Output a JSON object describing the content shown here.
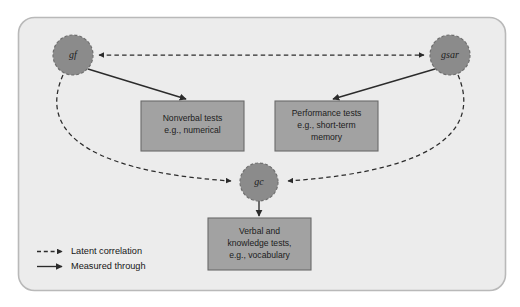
{
  "figure": {
    "type": "diagram",
    "panel": {
      "fill": "#ececec",
      "border": "#b9b9b9"
    },
    "colors": {
      "node_fill": "#8b8b8b",
      "node_stroke": "#6f6f6f",
      "box_fill": "#a2a2a2",
      "box_stroke": "#6a6a6a",
      "line": "#2b2b2b",
      "text": "#1c1c1c"
    }
  },
  "nodes": [
    {
      "id": "gf",
      "label": "gf",
      "cx": 73,
      "cy": 55,
      "r": 20
    },
    {
      "id": "gsar",
      "label": "gsar",
      "cx": 450,
      "cy": 55,
      "r": 20
    },
    {
      "id": "gc",
      "label": "gc",
      "cx": 259,
      "cy": 182,
      "r": 19
    }
  ],
  "boxes": [
    {
      "id": "nonverbal",
      "lines": [
        "Nonverbal tests",
        "e.g., numerical"
      ],
      "x": 141,
      "y": 101,
      "w": 103,
      "h": 50
    },
    {
      "id": "performance",
      "lines": [
        "Performance tests",
        "e.g., short-term",
        "memory"
      ],
      "x": 275,
      "y": 101,
      "w": 103,
      "h": 50
    },
    {
      "id": "verbal",
      "lines": [
        "Verbal and",
        "knowledge tests,",
        "e.g., vocabulary"
      ],
      "x": 208,
      "y": 218,
      "w": 103,
      "h": 52
    }
  ],
  "edges": [
    {
      "id": "gf-gsar-latent",
      "kind": "latent",
      "from": "gf",
      "to": "gsar",
      "bidirectional": true
    },
    {
      "id": "gf-gc-latent",
      "kind": "latent",
      "from": "gf",
      "to": "gc",
      "bidirectional": false
    },
    {
      "id": "gsar-gc-latent",
      "kind": "latent",
      "from": "gsar",
      "to": "gc",
      "bidirectional": false
    },
    {
      "id": "gf-nonverbal",
      "kind": "measured",
      "from": "gf",
      "to": "nonverbal"
    },
    {
      "id": "gsar-performance",
      "kind": "measured",
      "from": "gsar",
      "to": "performance"
    },
    {
      "id": "gc-verbal",
      "kind": "measured",
      "from": "gc",
      "to": "verbal"
    }
  ],
  "legend": {
    "items": [
      {
        "id": "latent",
        "style": "dashed",
        "label": "Latent correlation"
      },
      {
        "id": "measured",
        "style": "solid",
        "label": "Measured through"
      }
    ]
  }
}
